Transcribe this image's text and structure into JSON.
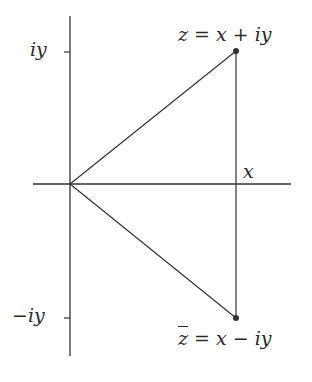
{
  "diagram": {
    "type": "complex-plane",
    "colors": {
      "line": "#333333",
      "point": "#333333",
      "text": "#2a2a2a",
      "background": "#ffffff"
    },
    "axes": {
      "horizontal_label": "x",
      "tick_labels": {
        "upper": "iy",
        "lower": "−iy"
      }
    },
    "points": [
      {
        "id": "z",
        "label_prefix": "z",
        "label_rest": " = x + iy"
      },
      {
        "id": "zbar",
        "label_prefix": "z",
        "label_rest": " = x − iy"
      }
    ]
  }
}
